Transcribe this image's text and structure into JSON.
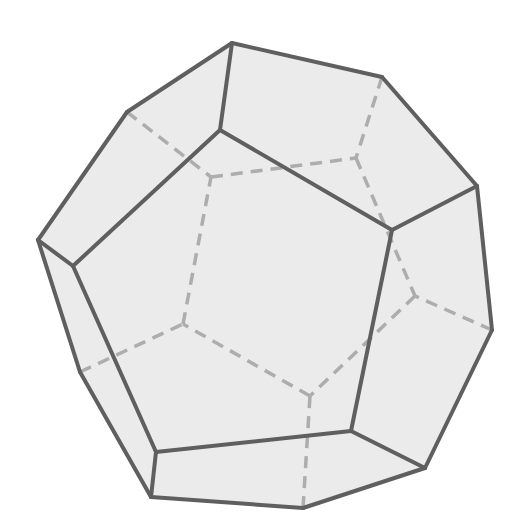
{
  "figure": {
    "title": "Dodecahedron",
    "colors": {
      "background": "#ffffff",
      "fill": "#ebebeb",
      "visible_edge": "#5f5f5f",
      "hidden_edge": "#adadad"
    },
    "stroke": {
      "visible_width": 4,
      "hidden_width": 3.5,
      "hidden_dash": "12 8"
    },
    "vertices": {
      "A": [
        232,
        43
      ],
      "B": [
        382,
        77
      ],
      "C": [
        477,
        186
      ],
      "D": [
        492,
        330
      ],
      "E": [
        425,
        468
      ],
      "F": [
        303,
        508
      ],
      "G": [
        151,
        497
      ],
      "H": [
        80,
        372
      ],
      "I": [
        38,
        240
      ],
      "J": [
        127,
        112
      ],
      "P1": [
        220,
        130
      ],
      "P2": [
        392,
        230
      ],
      "P3": [
        351,
        431
      ],
      "P4": [
        156,
        452
      ],
      "P5": [
        73,
        266
      ],
      "Q1": [
        211,
        177
      ],
      "Q2": [
        356,
        158
      ],
      "Q3": [
        415,
        296
      ],
      "Q4": [
        310,
        396
      ],
      "Q5": [
        183,
        324
      ]
    },
    "visible_edges": [
      [
        "A",
        "B"
      ],
      [
        "B",
        "C"
      ],
      [
        "C",
        "D"
      ],
      [
        "D",
        "E"
      ],
      [
        "E",
        "F"
      ],
      [
        "F",
        "G"
      ],
      [
        "G",
        "H"
      ],
      [
        "H",
        "I"
      ],
      [
        "I",
        "J"
      ],
      [
        "J",
        "A"
      ],
      [
        "P1",
        "P2"
      ],
      [
        "P2",
        "P3"
      ],
      [
        "P3",
        "P4"
      ],
      [
        "P4",
        "P5"
      ],
      [
        "P5",
        "P1"
      ],
      [
        "A",
        "P1"
      ],
      [
        "C",
        "P2"
      ],
      [
        "E",
        "P3"
      ],
      [
        "G",
        "P4"
      ],
      [
        "I",
        "P5"
      ]
    ],
    "hidden_edges": [
      [
        "Q1",
        "Q2"
      ],
      [
        "Q2",
        "Q3"
      ],
      [
        "Q3",
        "Q4"
      ],
      [
        "Q4",
        "Q5"
      ],
      [
        "Q5",
        "Q1"
      ],
      [
        "J",
        "Q1"
      ],
      [
        "B",
        "Q2"
      ],
      [
        "D",
        "Q3"
      ],
      [
        "F",
        "Q4"
      ],
      [
        "H",
        "Q5"
      ]
    ],
    "counts": {
      "faces": 12,
      "edges": 30,
      "vertices": 20
    }
  }
}
